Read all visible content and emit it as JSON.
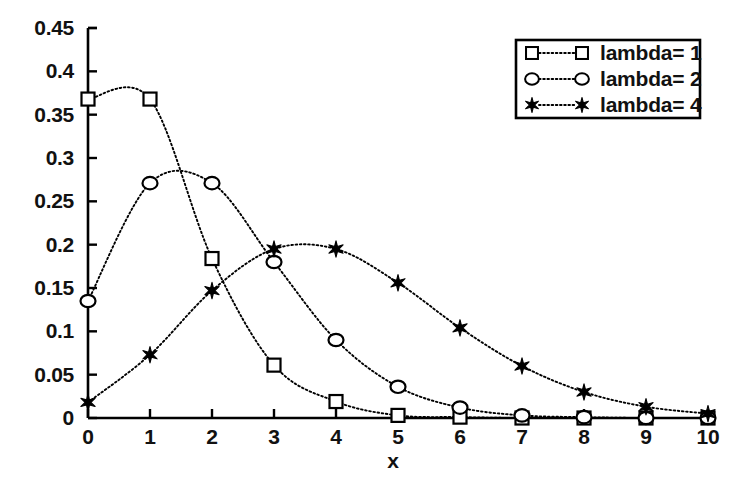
{
  "chart_data": {
    "type": "line",
    "title": "",
    "subtitle": "",
    "xlabel": "x",
    "ylabel": "",
    "xlim": [
      0,
      10
    ],
    "ylim": [
      0,
      0.45
    ],
    "grid": false,
    "legend_position": "top-right",
    "x": [
      0,
      1,
      2,
      3,
      4,
      5,
      6,
      7,
      8,
      9,
      10
    ],
    "xticks": [
      "0",
      "1",
      "2",
      "3",
      "4",
      "5",
      "6",
      "7",
      "8",
      "9",
      "10"
    ],
    "yticks": [
      "0",
      "0.05",
      "0.1",
      "0.15",
      "0.2",
      "0.25",
      "0.3",
      "0.35",
      "0.4",
      "0.45"
    ],
    "ytick_values": [
      0,
      0.05,
      0.1,
      0.15,
      0.2,
      0.25,
      0.3,
      0.35,
      0.4,
      0.45
    ],
    "series": [
      {
        "name": "lambda= 1",
        "marker": "square-open",
        "linestyle": "dotted",
        "color": "#000000",
        "values": [
          0.368,
          0.368,
          0.184,
          0.061,
          0.019,
          0.003,
          0.001,
          0.0,
          0.0,
          0.0,
          0.0
        ]
      },
      {
        "name": "lambda= 2",
        "marker": "circle-open",
        "linestyle": "dotted",
        "color": "#000000",
        "values": [
          0.135,
          0.271,
          0.271,
          0.18,
          0.09,
          0.036,
          0.012,
          0.003,
          0.001,
          0.0,
          0.0
        ]
      },
      {
        "name": "lambda= 4",
        "marker": "star-filled",
        "linestyle": "dotted",
        "color": "#000000",
        "values": [
          0.018,
          0.073,
          0.147,
          0.195,
          0.195,
          0.156,
          0.104,
          0.06,
          0.03,
          0.013,
          0.005
        ]
      }
    ]
  },
  "axes": {
    "x_axis_title": "x"
  },
  "legend": {
    "entries": [
      {
        "label": "lambda= 1",
        "marker": "square-open"
      },
      {
        "label": "lambda= 2",
        "marker": "circle-open"
      },
      {
        "label": "lambda= 4",
        "marker": "star-filled"
      }
    ]
  }
}
